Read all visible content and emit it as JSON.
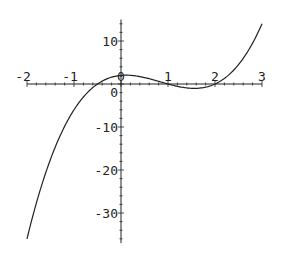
{
  "chart_data": {
    "type": "line",
    "title": "",
    "xlabel": "",
    "ylabel": "",
    "function": "(2x+1)(x-1)(x-2)",
    "xlim": [
      -2,
      3
    ],
    "ylim": [
      -37,
      15
    ],
    "grid": false,
    "legend": null,
    "x_ticks": [
      -2,
      -1,
      0,
      1,
      2,
      3
    ],
    "x_tick_labels": [
      "-2",
      "-1",
      "0",
      "1",
      "2",
      "3"
    ],
    "y_ticks": [
      -30,
      -20,
      -10,
      0,
      10
    ],
    "y_tick_labels": [
      "-30",
      "-20",
      "-10",
      "0",
      "10"
    ],
    "series": [
      {
        "name": "f(x)",
        "x": [
          -2,
          -1.5,
          -1,
          -0.5,
          0,
          0.5,
          1,
          1.5,
          2,
          2.5,
          3
        ],
        "y": [
          -36,
          -17.5,
          -6,
          0,
          2,
          1.5,
          0,
          -1,
          0,
          3,
          14
        ]
      }
    ],
    "color": "#222222"
  }
}
